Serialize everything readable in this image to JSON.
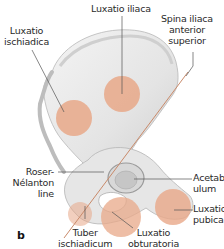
{
  "figure": {
    "panel_letter": "b",
    "colors": {
      "bone": "#e9e9e9",
      "bone_shadow": "#c4c4c4",
      "dislocation_circle": "#e8a888",
      "leader_line": "#555555",
      "roser_nelaton_line": "#c98a6a"
    }
  },
  "labels": {
    "luxatio_iliaca": "Luxatio iliaca",
    "luxatio_ischiadica": [
      "Luxatio",
      "ischiadica"
    ],
    "spina_iliaca": [
      "Spina iliaca",
      "anterior",
      "superior"
    ],
    "acetabulum": [
      "Acetab-",
      "ulum"
    ],
    "roser_nelaton": [
      "Roser-",
      "Nélanton",
      "line"
    ],
    "luxatio_pubica": [
      "Luxatio",
      "pubica"
    ],
    "tuber_ischiadicum": [
      "Tuber",
      "ischiadicum"
    ],
    "luxatio_obturatoria": [
      "Luxatio",
      "obturatoria"
    ]
  }
}
